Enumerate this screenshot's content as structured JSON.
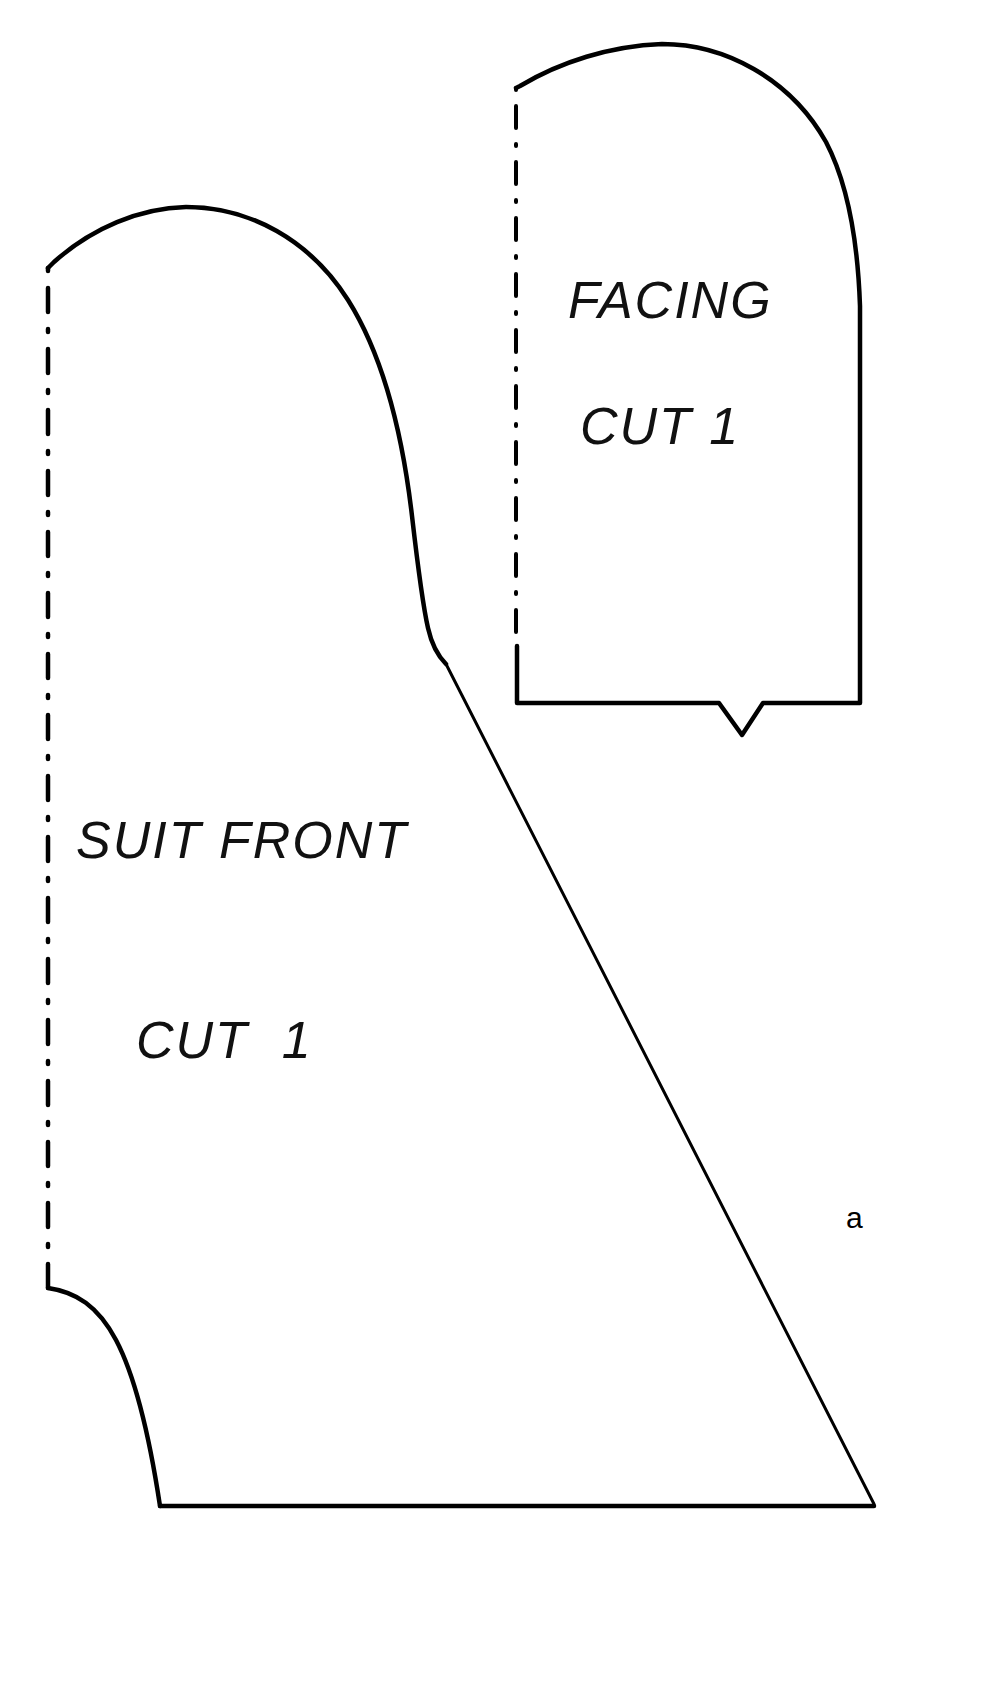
{
  "document": {
    "kind": "sewing-pattern-sheet",
    "background_color": "#ffffff",
    "ink_color": "#000000",
    "width": 984,
    "height": 1700
  },
  "pieces": {
    "facing": {
      "name_label": "FACING",
      "cut_label": "CUT 1",
      "fold_edge": "left",
      "has_notch": true,
      "notch_label": "V"
    },
    "suit_front": {
      "name_label": "SUIT FRONT",
      "cut_label": "CUT  1",
      "fold_edge": "left",
      "has_notch": false
    }
  },
  "annotations": {
    "seam_marker": "a"
  },
  "text_styles": {
    "facing_name_size": "52px",
    "facing_cut_size": "52px",
    "front_name_size": "52px",
    "front_cut_size": "52px",
    "marker_size": "30px"
  }
}
